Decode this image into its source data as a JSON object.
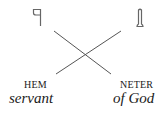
{
  "diagram": {
    "words": [
      {
        "transliteration": "HEM",
        "gloss": "servant",
        "glyph": "hem-hieroglyph"
      },
      {
        "transliteration": "NETER",
        "gloss": "of God",
        "glyph": "netjer-flag-hieroglyph"
      }
    ],
    "relation": "crossed-order",
    "colors": {
      "line": "#555555",
      "text": "#1a1a1a",
      "glyph": "#666666"
    }
  }
}
